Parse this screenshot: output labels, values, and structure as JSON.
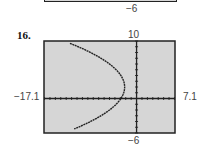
{
  "previous_exercise": {
    "ymin_label": "−6"
  },
  "exercise_number": "16.",
  "chart_data": {
    "type": "line",
    "title": "",
    "xlabel": "",
    "ylabel": "",
    "xlim": [
      -17.1,
      7.1
    ],
    "ylim": [
      -6,
      10
    ],
    "window_labels": {
      "xmin": "−17.1",
      "xmax": "7.1",
      "ymin": "−6",
      "ymax": "10"
    },
    "xscale": 1,
    "yscale": 1,
    "grid": false,
    "background": "#d6d6d6",
    "curve_color": "#222222",
    "series": [
      {
        "name": "parabola",
        "equation": "x = -0.175(y - 2)^2 - 2.2",
        "vertex": [
          -2.2,
          2
        ],
        "a": -0.175,
        "y_range": [
          -5.3,
          9.6
        ]
      }
    ]
  }
}
